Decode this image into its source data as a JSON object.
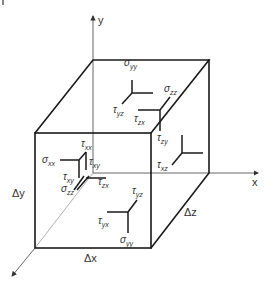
{
  "diagram": {
    "axes": {
      "x": "x",
      "y": "y",
      "z": ""
    },
    "dimensions": {
      "dx": "Δx",
      "dy": "Δy",
      "dz": "Δz"
    },
    "labels": {
      "sigma_yy_top": {
        "sym": "σ",
        "sub": "yy"
      },
      "tau_yz_top": {
        "sym": "τ",
        "sub": "yz"
      },
      "sigma_zz_back": {
        "sym": "σ",
        "sub": "zz"
      },
      "tau_zx_back": {
        "sym": "τ",
        "sub": "zx"
      },
      "tau_zy_back": {
        "sym": "τ",
        "sub": "zy"
      },
      "tau_xz_right": {
        "sym": "τ",
        "sub": "xz"
      },
      "tau_xx_left": {
        "sym": "τ",
        "sub": "xx"
      },
      "sigma_xx_left": {
        "sym": "σ",
        "sub": "xx"
      },
      "tau_xy_left": {
        "sym": "τ",
        "sub": "xy"
      },
      "tau_xy_left2": {
        "sym": "τ",
        "sub": "xy"
      },
      "sigma_zz_front": {
        "sym": "σ",
        "sub": "zz"
      },
      "tau_zx_front": {
        "sym": "τ",
        "sub": "zx"
      },
      "tau_yz_bottom": {
        "sym": "τ",
        "sub": "yz"
      },
      "tau_yx_bottom": {
        "sym": "τ",
        "sub": "yx"
      },
      "sigma_yy_bottom": {
        "sym": "σ",
        "sub": "yy"
      }
    },
    "colors": {
      "edge": "#1a1a1a",
      "axis": "#555555",
      "hidden": "#9a9a9a",
      "text": "#333333"
    }
  }
}
